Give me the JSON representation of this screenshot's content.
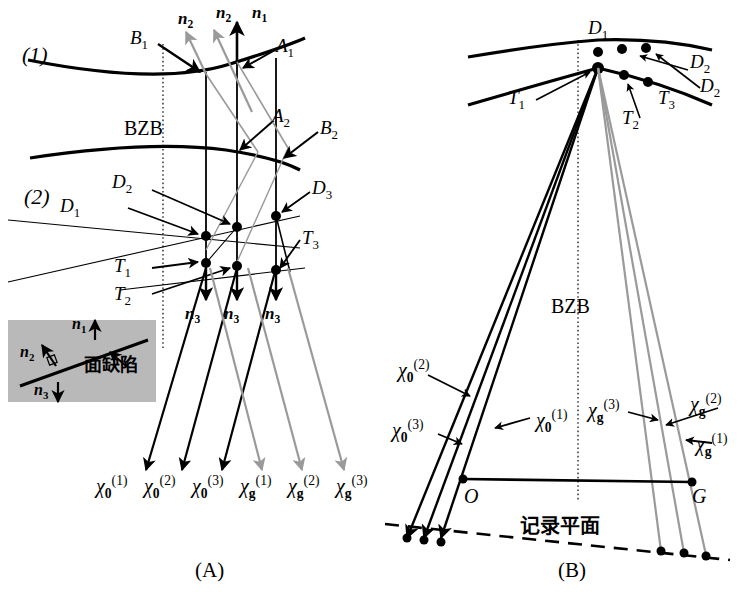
{
  "figure": {
    "panels": [
      {
        "id": "A",
        "caption": "(A)"
      },
      {
        "id": "B",
        "caption": "(B)"
      }
    ],
    "colors": {
      "black": "#000000",
      "gray_ray": "#9a9a9a",
      "inset_fill": "#b9b9b9",
      "dotted_line": "#555555"
    }
  },
  "panelA": {
    "curve_labels": {
      "top": "(1)",
      "bottom": "(2)"
    },
    "bzb_label": "BZB",
    "normals_top": [
      {
        "name": "n2_left",
        "base": "n",
        "sub": "2",
        "color": "gray"
      },
      {
        "name": "n2_mid",
        "base": "n",
        "sub": "2",
        "color": "gray"
      },
      {
        "name": "n1",
        "base": "n",
        "sub": "1",
        "color": "black"
      }
    ],
    "normals_bottom": [
      {
        "name": "n3_a",
        "base": "n",
        "sub": "3"
      },
      {
        "name": "n3_b",
        "base": "n",
        "sub": "3"
      },
      {
        "name": "n3_c",
        "base": "n",
        "sub": "3"
      }
    ],
    "points": [
      {
        "label": "B",
        "sub": "1"
      },
      {
        "label": "A",
        "sub": "1"
      },
      {
        "label": "A",
        "sub": "2"
      },
      {
        "label": "B",
        "sub": "2"
      },
      {
        "label": "D",
        "sub": "1"
      },
      {
        "label": "D",
        "sub": "2"
      },
      {
        "label": "D",
        "sub": "3"
      },
      {
        "label": "T",
        "sub": "1"
      },
      {
        "label": "T",
        "sub": "2"
      },
      {
        "label": "T",
        "sub": "3"
      }
    ],
    "inset": {
      "defect_label": "面缺陷",
      "vectors": [
        {
          "base": "n",
          "sub": "1"
        },
        {
          "base": "n",
          "sub": "2"
        },
        {
          "base": "n",
          "sub": "3"
        }
      ]
    },
    "exit_waves": [
      {
        "base": "χ",
        "sub": "0",
        "sup": "(1)",
        "color": "black"
      },
      {
        "base": "χ",
        "sub": "0",
        "sup": "(2)",
        "color": "black"
      },
      {
        "base": "χ",
        "sub": "0",
        "sup": "(3)",
        "color": "black"
      },
      {
        "base": "χ",
        "sub": "g",
        "sup": "(1)",
        "color": "gray"
      },
      {
        "base": "χ",
        "sub": "g",
        "sup": "(2)",
        "color": "gray"
      },
      {
        "base": "χ",
        "sub": "g",
        "sup": "(3)",
        "color": "gray"
      }
    ]
  },
  "panelB": {
    "bzb_label": "BZB",
    "recording_plane_label": "记录平面",
    "origin_label": "O",
    "reflection_label": "G",
    "upper_points": [
      {
        "label": "D",
        "sub": "1"
      },
      {
        "label": "D",
        "sub": "2"
      },
      {
        "label": "D",
        "sub": "2"
      }
    ],
    "lower_points": [
      {
        "label": "T",
        "sub": "1"
      },
      {
        "label": "T",
        "sub": "2"
      },
      {
        "label": "T",
        "sub": "3"
      }
    ],
    "left_waves": [
      {
        "base": "χ",
        "sub": "0",
        "sup": "(2)"
      },
      {
        "base": "χ",
        "sub": "0",
        "sup": "(1)"
      },
      {
        "base": "χ",
        "sub": "0",
        "sup": "(3)"
      }
    ],
    "right_waves": [
      {
        "base": "χ",
        "sub": "g",
        "sup": "(3)"
      },
      {
        "base": "χ",
        "sub": "g",
        "sup": "(2)"
      },
      {
        "base": "χ",
        "sub": "g",
        "sup": "(1)"
      }
    ]
  }
}
